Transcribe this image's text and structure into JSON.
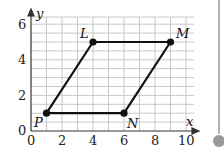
{
  "figure": {
    "type": "coordinate-grid-parallelogram",
    "axes": {
      "x_label": "x",
      "y_label": "y",
      "x_ticks": [
        "0",
        "2",
        "4",
        "6",
        "8",
        "10"
      ],
      "y_ticks": [
        "0",
        "2",
        "4",
        "6"
      ],
      "x_range": [
        0,
        10.5
      ],
      "y_range": [
        0,
        6.3
      ],
      "grid": true
    },
    "points": [
      {
        "name": "P",
        "x": 1,
        "y": 1
      },
      {
        "name": "L",
        "x": 4,
        "y": 5
      },
      {
        "name": "M",
        "x": 9,
        "y": 5
      },
      {
        "name": "N",
        "x": 6,
        "y": 1
      }
    ],
    "labels": {
      "P": "P",
      "L": "L",
      "M": "M",
      "N": "N",
      "x": "x",
      "y": "y",
      "t0x": "0",
      "t2x": "2",
      "t4x": "4",
      "t6x": "6",
      "t8x": "8",
      "t10x": "10",
      "t0y": "0",
      "t2y": "2",
      "t4y": "4",
      "t6y": "6"
    },
    "colors": {
      "grid": "#c8c8c8",
      "axis": "#333333",
      "shape": "#111111",
      "scroll": "#9a9a9a"
    }
  }
}
